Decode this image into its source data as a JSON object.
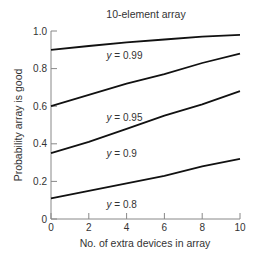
{
  "chart_data": {
    "type": "line",
    "title": "10-element array",
    "xlabel": "No. of extra devices in array",
    "ylabel": "Probability array is good",
    "xlim": [
      0,
      10
    ],
    "ylim": [
      0,
      1.0
    ],
    "x_ticks": [
      0,
      2,
      4,
      6,
      8,
      10
    ],
    "x_tick_labels": [
      "0",
      "2",
      "4",
      "6",
      "8",
      "10"
    ],
    "y_ticks": [
      0,
      0.2,
      0.4,
      0.6,
      0.8,
      1.0
    ],
    "y_tick_labels": [
      "0",
      "0.2",
      "0.4",
      "0.6",
      "0.8",
      "1.0"
    ],
    "grid": false,
    "legend": "inline labels below each line",
    "x": [
      0,
      2,
      4,
      6,
      8,
      10
    ],
    "series": [
      {
        "name": "y = 0.99",
        "label_var": "y",
        "label_val": " = 0.99",
        "values": [
          0.9,
          0.92,
          0.94,
          0.955,
          0.97,
          0.98
        ],
        "label_pos": [
          4,
          0.85
        ]
      },
      {
        "name": "y = 0.95",
        "label_var": "y",
        "label_val": " = 0.95",
        "values": [
          0.6,
          0.66,
          0.72,
          0.77,
          0.83,
          0.88
        ],
        "label_pos": [
          4,
          0.52
        ]
      },
      {
        "name": "y = 0.9",
        "label_var": "y",
        "label_val": " = 0.9",
        "values": [
          0.35,
          0.41,
          0.48,
          0.55,
          0.61,
          0.68
        ],
        "label_pos": [
          4,
          0.33
        ]
      },
      {
        "name": "y = 0.8",
        "label_var": "y",
        "label_val": " = 0.8",
        "values": [
          0.11,
          0.15,
          0.19,
          0.23,
          0.28,
          0.32
        ],
        "label_pos": [
          4,
          0.06
        ]
      }
    ]
  }
}
